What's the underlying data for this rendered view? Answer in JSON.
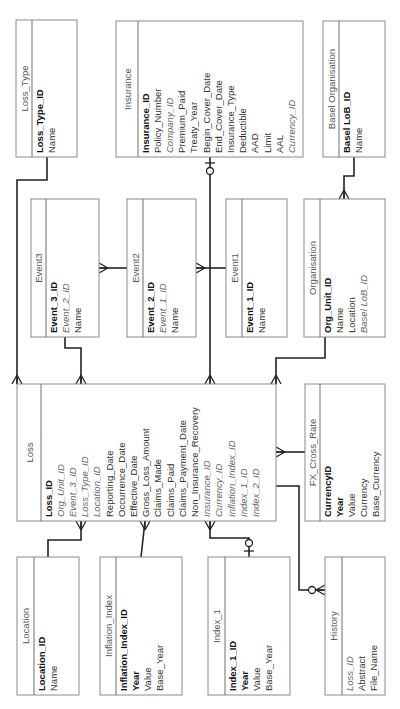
{
  "diagram": {
    "type": "entity-relationship",
    "orientation": "rotated-90-ccw",
    "entities": [
      {
        "id": "loss_type",
        "title": "Loss_Type",
        "box": [
          16,
          20,
          77,
          157
        ],
        "header_w": 16,
        "attributes": [
          {
            "name": "Loss_Type_ID",
            "kind": "pk"
          },
          {
            "name": "Name",
            "kind": "plain"
          }
        ]
      },
      {
        "id": "insurance",
        "title": "Insurance",
        "box": [
          116,
          21,
          303,
          157
        ],
        "header_w": 22,
        "attributes": [
          {
            "name": "Insurance_ID",
            "kind": "pk"
          },
          {
            "name": "Policy_Number",
            "kind": "plain"
          },
          {
            "name": "Company_ID",
            "kind": "fk"
          },
          {
            "name": "Premium_Paid",
            "kind": "plain"
          },
          {
            "name": "Treaty_Year",
            "kind": "plain"
          },
          {
            "name": "Begin_Cover_Date",
            "kind": "plain"
          },
          {
            "name": "End_Cover_Date",
            "kind": "plain"
          },
          {
            "name": "Insurance_Type",
            "kind": "plain"
          },
          {
            "name": "Deductible",
            "kind": "plain"
          },
          {
            "name": "AAD",
            "kind": "plain"
          },
          {
            "name": "Limit",
            "kind": "plain"
          },
          {
            "name": "AAL",
            "kind": "plain"
          },
          {
            "name": "Currency_ID",
            "kind": "fk"
          }
        ]
      },
      {
        "id": "basel_org",
        "title": "Basel Organisation",
        "box": [
          323,
          21,
          385,
          157
        ],
        "header_w": 16,
        "attributes": [
          {
            "name": "Basel LoB_ID",
            "kind": "pk"
          },
          {
            "name": "Name",
            "kind": "plain"
          }
        ]
      },
      {
        "id": "event3",
        "title": "Event3",
        "box": [
          31,
          199,
          99,
          337
        ],
        "header_w": 15,
        "attributes": [
          {
            "name": "Event_3_ID",
            "kind": "pk"
          },
          {
            "name": "Event_2_ID",
            "kind": "fk"
          },
          {
            "name": "Name",
            "kind": "plain"
          }
        ]
      },
      {
        "id": "event2",
        "title": "Event2",
        "box": [
          127,
          199,
          196,
          337
        ],
        "header_w": 16,
        "attributes": [
          {
            "name": "Event_2_ID",
            "kind": "pk"
          },
          {
            "name": "Event_1_ID",
            "kind": "fk"
          },
          {
            "name": "Name",
            "kind": "plain"
          }
        ]
      },
      {
        "id": "event1",
        "title": "Event1",
        "box": [
          226,
          199,
          287,
          337
        ],
        "header_w": 16,
        "attributes": [
          {
            "name": "Event_1_ID",
            "kind": "pk"
          },
          {
            "name": "Name",
            "kind": "plain"
          }
        ]
      },
      {
        "id": "organisation",
        "title": "Organisation",
        "box": [
          304,
          199,
          385,
          337
        ],
        "header_w": 16,
        "attributes": [
          {
            "name": "Org_Unit_ID",
            "kind": "pk"
          },
          {
            "name": "Name",
            "kind": "plain"
          },
          {
            "name": "Location",
            "kind": "plain"
          },
          {
            "name": "Basel LoB_ID",
            "kind": "fk"
          }
        ]
      },
      {
        "id": "loss",
        "title": "Loss",
        "box": [
          17,
          384,
          276,
          521
        ],
        "header_w": 24,
        "attributes": [
          {
            "name": "Loss_ID",
            "kind": "pk"
          },
          {
            "name": "Org_Unit_ID",
            "kind": "fk"
          },
          {
            "name": "Event_3_ID",
            "kind": "fk"
          },
          {
            "name": "Loss_Type_ID",
            "kind": "fk"
          },
          {
            "name": "Location_ID",
            "kind": "fk"
          },
          {
            "name": "Reporting_Date",
            "kind": "plain"
          },
          {
            "name": "Occurrence_Date",
            "kind": "plain"
          },
          {
            "name": "Effective_Date",
            "kind": "plain"
          },
          {
            "name": "Gross_Loss_Amount",
            "kind": "plain"
          },
          {
            "name": "Claims_Made",
            "kind": "plain"
          },
          {
            "name": "Claims_Paid",
            "kind": "plain"
          },
          {
            "name": "Claims_Payment_Date",
            "kind": "plain"
          },
          {
            "name": "Non_Insurance_Recovery",
            "kind": "plain"
          },
          {
            "name": "Insurance_ID",
            "kind": "fk"
          },
          {
            "name": "Currency_ID",
            "kind": "fk"
          },
          {
            "name": "Inflation_Index_ID",
            "kind": "fk"
          },
          {
            "name": "Index_1_ID",
            "kind": "fk"
          },
          {
            "name": "Index_2_ID",
            "kind": "fk"
          }
        ]
      },
      {
        "id": "fx",
        "title": "FX_Cross_Rate",
        "box": [
          305,
          384,
          385,
          521
        ],
        "header_w": 15,
        "attributes": [
          {
            "name": "CurrencyID",
            "kind": "pk"
          },
          {
            "name": "Year",
            "kind": "pk"
          },
          {
            "name": "Value",
            "kind": "plain"
          },
          {
            "name": "Currency",
            "kind": "plain"
          },
          {
            "name": "Base_Currency",
            "kind": "plain"
          }
        ]
      },
      {
        "id": "location",
        "title": "Location",
        "box": [
          17,
          557,
          79,
          695
        ],
        "header_w": 17,
        "attributes": [
          {
            "name": "Location_ID",
            "kind": "pk"
          },
          {
            "name": "Name",
            "kind": "plain"
          }
        ]
      },
      {
        "id": "inflation",
        "title": "Inflation_Index",
        "box": [
          100,
          557,
          182,
          695
        ],
        "header_w": 16,
        "attributes": [
          {
            "name": "Inflation_Index_ID",
            "kind": "pk"
          },
          {
            "name": "Year",
            "kind": "pk"
          },
          {
            "name": "Value",
            "kind": "plain"
          },
          {
            "name": "Base_Year",
            "kind": "plain"
          }
        ]
      },
      {
        "id": "index1",
        "title": "Index_1",
        "box": [
          208,
          557,
          290,
          695
        ],
        "header_w": 17,
        "attributes": [
          {
            "name": "Index_1_ID",
            "kind": "pk"
          },
          {
            "name": "Year",
            "kind": "pk"
          },
          {
            "name": "Value",
            "kind": "plain"
          },
          {
            "name": "Base_Year",
            "kind": "plain"
          }
        ]
      },
      {
        "id": "history",
        "title": "History",
        "box": [
          325,
          557,
          385,
          695
        ],
        "header_w": 17,
        "attributes": [
          {
            "name": "Loss_ID",
            "kind": "fk"
          },
          {
            "name": "Abstract",
            "kind": "plain"
          },
          {
            "name": "File_Name",
            "kind": "plain"
          }
        ]
      }
    ],
    "relationships": [
      {
        "from": "loss_type",
        "to": "loss",
        "cardinality": "one-to-many",
        "path": [
          [
            47,
            157
          ],
          [
            47,
            180
          ],
          [
            17,
            180
          ],
          [
            17,
            384
          ]
        ],
        "end": "crow-up",
        "end_at": [
          17,
          384
        ]
      },
      {
        "from": "event3",
        "to": "loss",
        "cardinality": "one-to-many",
        "path": [
          [
            65,
            337
          ],
          [
            65,
            348
          ],
          [
            81,
            348
          ],
          [
            81,
            384
          ]
        ],
        "end": "crow-up",
        "end_at": [
          81,
          384
        ]
      },
      {
        "from": "event2",
        "to": "event3",
        "cardinality": "one-to-many",
        "path": [
          [
            127,
            268
          ],
          [
            99,
            268
          ]
        ],
        "end": "crow-left",
        "end_at": [
          99,
          268
        ]
      },
      {
        "from": "event1",
        "to": "event2",
        "cardinality": "one-to-many",
        "path": [
          [
            226,
            268
          ],
          [
            196,
            268
          ]
        ],
        "end": "crow-left",
        "end_at": [
          196,
          268
        ]
      },
      {
        "from": "insurance",
        "to": "loss",
        "cardinality": "zero-or-one-to-many",
        "path": [
          [
            210,
            157
          ],
          [
            210,
            384
          ]
        ],
        "end": "crow-up",
        "end_at": [
          210,
          384
        ],
        "start_symbol": "circle-bar",
        "start_at": [
          210,
          157
        ]
      },
      {
        "from": "basel_org",
        "to": "organisation",
        "cardinality": "one-to-many",
        "path": [
          [
            354,
            157
          ],
          [
            354,
            176
          ],
          [
            344,
            176
          ],
          [
            344,
            199
          ]
        ],
        "end": "crow-up",
        "end_at": [
          344,
          199
        ]
      },
      {
        "from": "organisation",
        "to": "loss",
        "cardinality": "one-to-many",
        "path": [
          [
            325,
            337
          ],
          [
            325,
            358
          ],
          [
            276,
            358
          ],
          [
            276,
            384
          ]
        ],
        "end": "crow-up",
        "end_at": [
          276,
          384
        ]
      },
      {
        "from": "fx",
        "to": "loss",
        "cardinality": "one-to-many",
        "path": [
          [
            305,
            452
          ],
          [
            276,
            452
          ]
        ],
        "end": "crow-left",
        "end_at": [
          276,
          452
        ]
      },
      {
        "from": "location",
        "to": "loss",
        "cardinality": "one-to-many",
        "path": [
          [
            48,
            557
          ],
          [
            48,
            540
          ],
          [
            81,
            540
          ],
          [
            81,
            521
          ]
        ],
        "end": "crow-down",
        "end_at": [
          81,
          521
        ]
      },
      {
        "from": "inflation",
        "to": "loss",
        "cardinality": "one-to-many",
        "path": [
          [
            141,
            557
          ],
          [
            145,
            521
          ]
        ],
        "end": "crow-down",
        "end_at": [
          145,
          521
        ]
      },
      {
        "from": "index1",
        "to": "loss",
        "cardinality": "zero-or-one-to-many",
        "path": [
          [
            249,
            557
          ],
          [
            249,
            538
          ],
          [
            210,
            538
          ],
          [
            210,
            521
          ]
        ],
        "end": "crow-down",
        "end_at": [
          210,
          521
        ],
        "start_symbol": "bar-circle",
        "start_at": [
          249,
          557
        ]
      },
      {
        "from": "loss",
        "to": "history",
        "cardinality": "one-to-zero-or-many",
        "path": [
          [
            276,
            486
          ],
          [
            299,
            486
          ],
          [
            299,
            590
          ],
          [
            325,
            590
          ]
        ],
        "end": "crow-right-circle",
        "end_at": [
          325,
          590
        ]
      }
    ]
  }
}
